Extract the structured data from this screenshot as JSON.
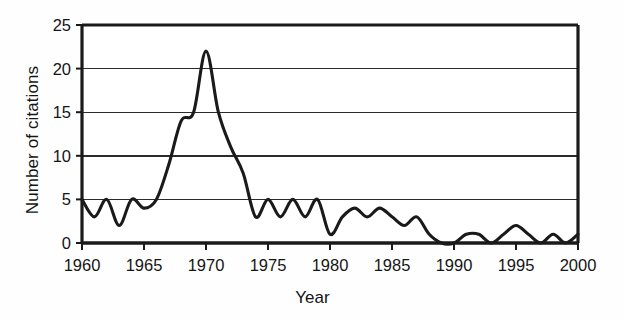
{
  "chart_data": {
    "type": "line",
    "title": "",
    "xlabel": "Year",
    "ylabel": "Number of citations",
    "xlim": [
      1960,
      2000
    ],
    "ylim": [
      0,
      25
    ],
    "xticks": [
      1960,
      1965,
      1970,
      1975,
      1980,
      1985,
      1990,
      1995,
      2000
    ],
    "yticks": [
      0,
      5,
      10,
      15,
      20,
      25
    ],
    "grid": "horizontal",
    "legend": "none",
    "series_color": "#1a1a1a",
    "x": [
      1960,
      1961,
      1962,
      1963,
      1964,
      1965,
      1966,
      1967,
      1968,
      1969,
      1970,
      1971,
      1972,
      1973,
      1974,
      1975,
      1976,
      1977,
      1978,
      1979,
      1980,
      1981,
      1982,
      1983,
      1984,
      1985,
      1986,
      1987,
      1988,
      1989,
      1990,
      1991,
      1992,
      1993,
      1994,
      1995,
      1996,
      1997,
      1998,
      1999,
      2000
    ],
    "values": [
      5,
      3,
      5,
      2,
      5,
      4,
      5,
      9,
      14,
      15,
      22,
      15,
      11,
      8,
      3,
      5,
      3,
      5,
      3,
      5,
      1,
      3,
      4,
      3,
      4,
      3,
      2,
      3,
      1,
      0,
      0,
      1,
      1,
      0,
      1,
      2,
      1,
      0,
      1,
      0,
      1
    ],
    "series": [
      {
        "name": "Number of citations",
        "points": [
          {
            "year": 1960,
            "value": 5
          },
          {
            "year": 1961,
            "value": 3
          },
          {
            "year": 1962,
            "value": 5
          },
          {
            "year": 1963,
            "value": 2
          },
          {
            "year": 1964,
            "value": 5
          },
          {
            "year": 1965,
            "value": 4
          },
          {
            "year": 1966,
            "value": 5
          },
          {
            "year": 1967,
            "value": 9
          },
          {
            "year": 1968,
            "value": 14
          },
          {
            "year": 1969,
            "value": 15
          },
          {
            "year": 1970,
            "value": 22
          },
          {
            "year": 1971,
            "value": 15
          },
          {
            "year": 1972,
            "value": 11
          },
          {
            "year": 1973,
            "value": 8
          },
          {
            "year": 1974,
            "value": 3
          },
          {
            "year": 1975,
            "value": 5
          },
          {
            "year": 1976,
            "value": 3
          },
          {
            "year": 1977,
            "value": 5
          },
          {
            "year": 1978,
            "value": 3
          },
          {
            "year": 1979,
            "value": 5
          },
          {
            "year": 1980,
            "value": 1
          },
          {
            "year": 1981,
            "value": 3
          },
          {
            "year": 1982,
            "value": 4
          },
          {
            "year": 1983,
            "value": 3
          },
          {
            "year": 1984,
            "value": 4
          },
          {
            "year": 1985,
            "value": 3
          },
          {
            "year": 1986,
            "value": 2
          },
          {
            "year": 1987,
            "value": 3
          },
          {
            "year": 1988,
            "value": 1
          },
          {
            "year": 1989,
            "value": 0
          },
          {
            "year": 1990,
            "value": 0
          },
          {
            "year": 1991,
            "value": 1
          },
          {
            "year": 1992,
            "value": 1
          },
          {
            "year": 1993,
            "value": 0
          },
          {
            "year": 1994,
            "value": 1
          },
          {
            "year": 1995,
            "value": 2
          },
          {
            "year": 1996,
            "value": 1
          },
          {
            "year": 1997,
            "value": 0
          },
          {
            "year": 1998,
            "value": 1
          },
          {
            "year": 1999,
            "value": 0
          },
          {
            "year": 2000,
            "value": 1
          }
        ]
      }
    ]
  },
  "axis": {
    "y_title": "Number of citations",
    "x_title": "Year",
    "y_tick_labels": [
      "0",
      "5",
      "10",
      "15",
      "20",
      "25"
    ],
    "x_tick_labels": [
      "1960",
      "1965",
      "1970",
      "1975",
      "1980",
      "1985",
      "1990",
      "1995",
      "2000"
    ]
  }
}
